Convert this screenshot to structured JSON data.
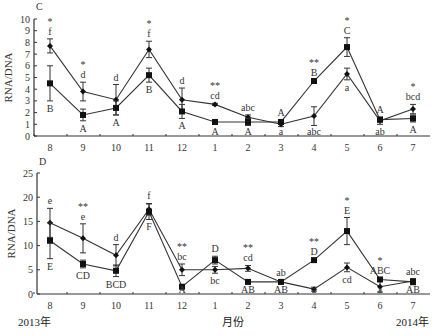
{
  "figure": {
    "footer": {
      "start_year": "2013年",
      "xlabel": "月份",
      "end_year": "2014年"
    }
  },
  "chart_data": [
    {
      "panel": "C",
      "type": "line",
      "title": "",
      "xlabel": "月份",
      "ylabel": "RNA/DNA",
      "categories": [
        "8",
        "9",
        "10",
        "11",
        "12",
        "1",
        "2",
        "3",
        "4",
        "5",
        "6",
        "7"
      ],
      "ylim": [
        0,
        10
      ],
      "yticks": [
        0,
        1,
        2,
        3,
        4,
        5,
        6,
        7,
        8,
        9,
        10
      ],
      "grid": false,
      "series": [
        {
          "name": "series-lowercase-letters",
          "marker": "diamond",
          "values": [
            7.7,
            3.8,
            3.1,
            7.4,
            3.1,
            2.7,
            1.6,
            1.0,
            1.7,
            5.3,
            1.3,
            2.3
          ],
          "errors": [
            0.6,
            0.8,
            1.3,
            0.7,
            1.0,
            0.1,
            0.2,
            0.2,
            0.8,
            0.5,
            0.3,
            0.4
          ]
        },
        {
          "name": "series-uppercase-letters",
          "marker": "square",
          "values": [
            4.5,
            1.8,
            2.4,
            5.2,
            2.1,
            1.2,
            1.2,
            1.2,
            4.7,
            7.6,
            1.4,
            1.5
          ],
          "errors": [
            1.5,
            0.5,
            0.6,
            0.6,
            0.6,
            0.2,
            0.3,
            0.2,
            0.1,
            0.8,
            0.2,
            0.3
          ]
        }
      ],
      "annotations": [
        {
          "x": "8",
          "sig": "*",
          "upper": "f",
          "lower": "B"
        },
        {
          "x": "9",
          "sig": "*",
          "upper": "d",
          "lower": "A"
        },
        {
          "x": "10",
          "sig": "",
          "upper": "d",
          "lower": "A"
        },
        {
          "x": "11",
          "sig": "*",
          "upper": "f",
          "lower": "B"
        },
        {
          "x": "12",
          "sig": "",
          "upper": "d",
          "lower": "A"
        },
        {
          "x": "1",
          "sig": "**",
          "upper": "cd",
          "lower": "A"
        },
        {
          "x": "2",
          "sig": "",
          "upper": "abc",
          "lower": "A"
        },
        {
          "x": "3",
          "sig": "",
          "upper": "A",
          "lower": "a"
        },
        {
          "x": "4",
          "sig": "**",
          "upper": "B",
          "lower": "abc"
        },
        {
          "x": "5",
          "sig": "*",
          "upper": "C",
          "lower": "a"
        },
        {
          "x": "6",
          "sig": "",
          "upper": "A",
          "lower": "ab"
        },
        {
          "x": "7",
          "sig": "*",
          "upper": "bcd",
          "lower": "A"
        }
      ]
    },
    {
      "panel": "D",
      "type": "line",
      "title": "",
      "xlabel": "月份",
      "ylabel": "RNA/DNA",
      "categories": [
        "8",
        "9",
        "10",
        "11",
        "12",
        "1",
        "2",
        "3",
        "4",
        "5",
        "6",
        "7"
      ],
      "ylim": [
        0,
        25
      ],
      "yticks": [
        0,
        5,
        10,
        15,
        20,
        25
      ],
      "grid": false,
      "series": [
        {
          "name": "series-lowercase-letters",
          "marker": "diamond",
          "values": [
            14.7,
            11.5,
            8.0,
            17.5,
            5.0,
            5.0,
            5.3,
            2.5,
            1.0,
            5.5,
            1.5,
            2.7
          ],
          "errors": [
            3.0,
            3.0,
            2.2,
            1.2,
            1.2,
            0.7,
            0.6,
            0.4,
            0.4,
            0.9,
            1.1,
            0.5
          ]
        },
        {
          "name": "series-uppercase-letters",
          "marker": "square",
          "values": [
            11.0,
            6.2,
            4.8,
            17.0,
            1.5,
            7.0,
            2.5,
            2.5,
            7.0,
            13.0,
            3.0,
            2.5
          ],
          "errors": [
            3.7,
            0.8,
            1.2,
            1.6,
            0.3,
            0.8,
            0.3,
            0.4,
            0.3,
            2.8,
            0.4,
            0.6
          ]
        }
      ],
      "annotations": [
        {
          "x": "8",
          "sig": "",
          "upper": "e",
          "lower": "E"
        },
        {
          "x": "9",
          "sig": "**",
          "upper": "e",
          "lower": "CD"
        },
        {
          "x": "10",
          "sig": "",
          "upper": "d",
          "lower": "BCD"
        },
        {
          "x": "11",
          "sig": "",
          "upper": "f",
          "lower": "F"
        },
        {
          "x": "12",
          "sig": "**",
          "upper": "bc",
          "lower": "A"
        },
        {
          "x": "1",
          "sig": "",
          "upper": "D",
          "lower": "bc"
        },
        {
          "x": "2",
          "sig": "**",
          "upper": "cd",
          "lower": "AB"
        },
        {
          "x": "3",
          "sig": "",
          "upper": "ab",
          "lower": "AB"
        },
        {
          "x": "4",
          "sig": "**",
          "upper": "D",
          "lower": "a"
        },
        {
          "x": "5",
          "sig": "*",
          "upper": "E",
          "lower": "cd"
        },
        {
          "x": "6",
          "sig": "*",
          "upper": "ABC",
          "lower": "a"
        },
        {
          "x": "7",
          "sig": "",
          "upper": "abc",
          "lower": "AB"
        }
      ]
    }
  ]
}
